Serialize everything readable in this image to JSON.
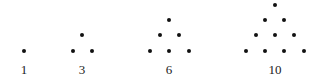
{
  "figure": {
    "dot_color": "#111111",
    "groups": [
      {
        "label": "1",
        "label_x": 24,
        "dots": [
          [
            24,
            51
          ]
        ]
      },
      {
        "label": "3",
        "label_x": 82,
        "dots": [
          [
            82,
            35
          ],
          [
            73,
            51
          ],
          [
            92,
            51
          ]
        ]
      },
      {
        "label": "6",
        "label_x": 169,
        "dots": [
          [
            169,
            20
          ],
          [
            160,
            35
          ],
          [
            179,
            35
          ],
          [
            150,
            51
          ],
          [
            169,
            51
          ],
          [
            189,
            51
          ]
        ]
      },
      {
        "label": "10",
        "label_x": 275,
        "dots": [
          [
            275,
            5
          ],
          [
            265,
            20
          ],
          [
            284,
            20
          ],
          [
            256,
            35
          ],
          [
            275,
            35
          ],
          [
            294,
            35
          ],
          [
            246,
            51
          ],
          [
            265,
            51
          ],
          [
            284,
            51
          ],
          [
            304,
            51
          ]
        ]
      }
    ]
  }
}
